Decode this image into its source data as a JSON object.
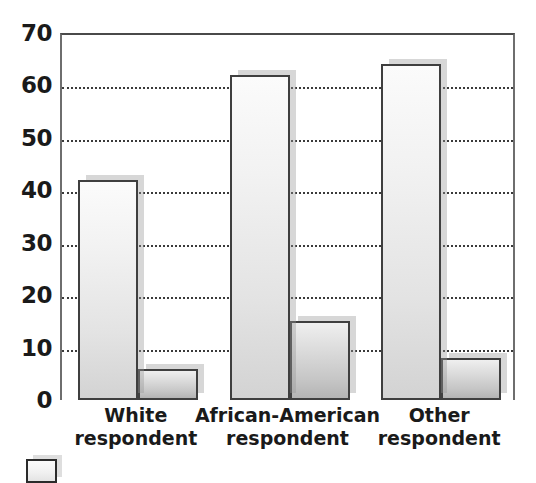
{
  "chart_data": {
    "type": "bar",
    "title": "",
    "subtitle": "",
    "xlabel": "",
    "ylabel": "",
    "ylim": [
      0,
      70
    ],
    "y_ticks": [
      0,
      10,
      20,
      30,
      40,
      50,
      60,
      70
    ],
    "y_tick_labels": [
      "0",
      "10",
      "20",
      "30",
      "40",
      "50",
      "60",
      "70"
    ],
    "grid": true,
    "grid_axis": "y",
    "grid_style": "dotted",
    "categories": [
      "White respondent",
      "African-American respondent",
      "Other respondent"
    ],
    "category_lines": [
      [
        "White",
        "respondent"
      ],
      [
        "African-American",
        "respondent"
      ],
      [
        "Other",
        "respondent"
      ]
    ],
    "series": [
      {
        "name": "",
        "values": [
          42,
          62,
          64
        ],
        "fill_top": "#fbfbfb",
        "fill_bottom": "#d3d3d3",
        "border": "#3f3f3f"
      },
      {
        "name": "",
        "values": [
          6,
          15,
          8
        ],
        "fill_top": "#efefef",
        "fill_bottom": "#b4b4b4",
        "border": "#3f3f3f"
      }
    ],
    "legend": {
      "position": "bottom-left",
      "entries": [
        {
          "label": "",
          "swatch_color": "#f0f0f0",
          "swatch_border": "#2b2b2b"
        }
      ]
    },
    "colors": {
      "background": "#ffffff",
      "axis": "#6e6e6e",
      "grid": "#3a3a3a",
      "text": "#1a1a1a",
      "bar_shadow": "#9a9a9a"
    }
  }
}
